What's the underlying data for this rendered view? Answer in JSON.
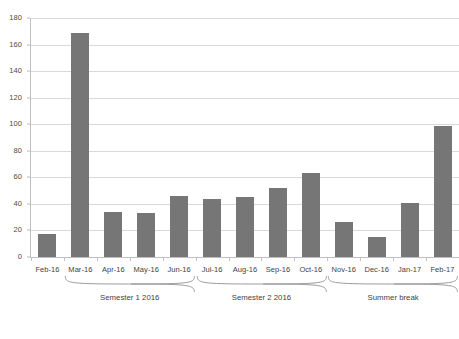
{
  "chart_data": {
    "type": "bar",
    "title": "",
    "subtitle": "",
    "xlabel": "",
    "ylabel": "",
    "ylim": [
      0,
      180
    ],
    "ytick_step": 20,
    "yticks": [
      0,
      20,
      40,
      60,
      80,
      100,
      120,
      140,
      160,
      180
    ],
    "grid": true,
    "legend": null,
    "bar_color": "#767676",
    "gridline_color": "#d9d9d9",
    "axis_color": "#bfbfbf",
    "categories": [
      "Feb-16",
      "Mar-16",
      "Apr-16",
      "May-16",
      "Jun-16",
      "Jul-16",
      "Aug-16",
      "Sep-16",
      "Oct-16",
      "Nov-16",
      "Dec-16",
      "Jan-17",
      "Feb-17"
    ],
    "values": [
      17,
      169,
      34,
      33,
      46,
      44,
      45,
      52,
      63,
      26,
      15,
      41,
      99
    ],
    "annotations": [
      {
        "label": "Semester 1 2016",
        "from": "Mar-16",
        "to": "Jun-16"
      },
      {
        "label": "Semester 2 2016",
        "from": "Jul-16",
        "to": "Oct-16"
      },
      {
        "label": "Summer break",
        "from": "Nov-16",
        "to": "Feb-17"
      }
    ]
  },
  "caption": "",
  "groups": [
    {
      "label": "Semester 1 2016",
      "start_index": 1,
      "end_index": 4
    },
    {
      "label": "Semester 2 2016",
      "start_index": 5,
      "end_index": 8
    },
    {
      "label": "Summer break",
      "start_index": 9,
      "end_index": 12
    }
  ]
}
